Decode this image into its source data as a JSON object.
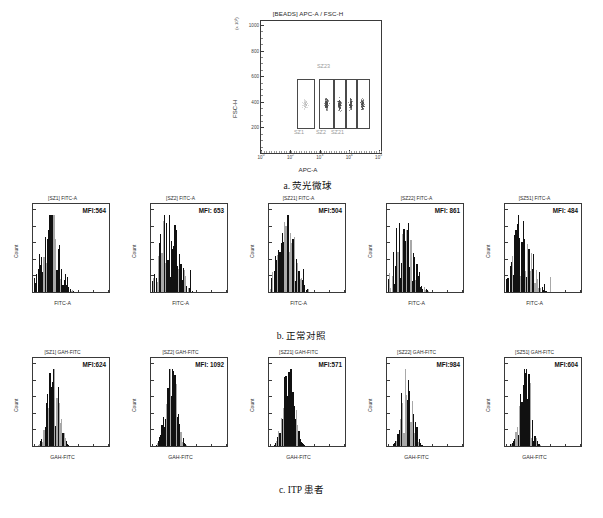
{
  "figure": {
    "scatter": {
      "title": "[BEADS] APC-A / FSC-H",
      "xlabel": "APC-A",
      "ylabel": "FSC-H",
      "y_multiplier": "(x 10³)",
      "caption": "a. 荧光微球",
      "y_ticks": [
        "200",
        "400",
        "600",
        "800",
        "1000"
      ],
      "x_ticks": [
        "10⁰",
        "10²",
        "10³",
        "10⁴",
        "10⁵"
      ],
      "gates": [
        {
          "label": "SZ1"
        },
        {
          "label": "SZ2"
        },
        {
          "label": "SZ21"
        },
        {
          "label": "SZ22"
        },
        {
          "label": "SZ23"
        }
      ],
      "upper_gate_label": "SZ23"
    },
    "row_b": {
      "caption": "b. 正常对照",
      "xlabel": "FITC-A",
      "ylabel": "Count",
      "panels": [
        {
          "title": "[SZ1] FITC-A",
          "mfi": "MFI:564"
        },
        {
          "title": "[SZ2] FITC-A",
          "mfi": "MFI: 653"
        },
        {
          "title": "[SZ21] FITC-A",
          "mfi": "MFI:504"
        },
        {
          "title": "[SZ22] FITC-A",
          "mfi": "MFI: 861"
        },
        {
          "title": "[SZ51] FITC-A",
          "mfi": "MFI: 484"
        }
      ]
    },
    "row_c": {
      "caption": "c. ITP 患者",
      "xlabel": "GAH-FITC",
      "ylabel": "Count",
      "panels": [
        {
          "title": "[SZ1] GAH-FITC",
          "mfi": "MFI:624"
        },
        {
          "title": "[SZ2] GAH-FITC",
          "mfi": "MFI: 1092"
        },
        {
          "title": "[SZ21] GAH-FITC",
          "mfi": "MFI:571"
        },
        {
          "title": "[SZ22] GAH-FITC",
          "mfi": "MFI:984"
        },
        {
          "title": "[SZ51] GAH-FITC",
          "mfi": "MFI:604"
        }
      ]
    }
  },
  "chart_data": {
    "type": "scatter",
    "title": "[BEADS] APC-A / FSC-H",
    "xlabel": "APC-A",
    "ylabel": "FSC-H",
    "xscale": "log",
    "xlim": [
      1,
      100000
    ],
    "ylim": [
      0,
      1000
    ],
    "grid": false,
    "legend": "none",
    "annotations": [
      "SZ1",
      "SZ2",
      "SZ21",
      "SZ22",
      "SZ23"
    ],
    "clusters": [
      {
        "name": "SZ1",
        "x_center": 120,
        "y_center": 420,
        "n": 60
      },
      {
        "name": "SZ2",
        "x_center": 900,
        "y_center": 420,
        "n": 130
      },
      {
        "name": "SZ21",
        "x_center": 2000,
        "y_center": 420,
        "n": 120
      },
      {
        "name": "SZ22",
        "x_center": 4200,
        "y_center": 415,
        "n": 100
      },
      {
        "name": "SZ23",
        "x_center": 8000,
        "y_center": 405,
        "n": 90
      }
    ],
    "histograms": [
      {
        "panel": "b1",
        "title": "[SZ1] FITC-A",
        "mfi": 564,
        "xlabel": "FITC-A",
        "ylabel": "Count"
      },
      {
        "panel": "b2",
        "title": "[SZ2] FITC-A",
        "mfi": 653,
        "xlabel": "FITC-A",
        "ylabel": "Count"
      },
      {
        "panel": "b3",
        "title": "[SZ21] FITC-A",
        "mfi": 504,
        "xlabel": "FITC-A",
        "ylabel": "Count"
      },
      {
        "panel": "b4",
        "title": "[SZ22] FITC-A",
        "mfi": 861,
        "xlabel": "FITC-A",
        "ylabel": "Count"
      },
      {
        "panel": "b5",
        "title": "[SZ51] FITC-A",
        "mfi": 484,
        "xlabel": "FITC-A",
        "ylabel": "Count"
      },
      {
        "panel": "c1",
        "title": "[SZ1] GAH-FITC",
        "mfi": 624,
        "xlabel": "GAH-FITC",
        "ylabel": "Count"
      },
      {
        "panel": "c2",
        "title": "[SZ2] GAH-FITC",
        "mfi": 1092,
        "xlabel": "GAH-FITC",
        "ylabel": "Count"
      },
      {
        "panel": "c3",
        "title": "[SZ21] GAH-FITC",
        "mfi": 571,
        "xlabel": "GAH-FITC",
        "ylabel": "Count"
      },
      {
        "panel": "c4",
        "title": "[SZ22] GAH-FITC",
        "mfi": 984,
        "xlabel": "GAH-FITC",
        "ylabel": "Count"
      },
      {
        "panel": "c5",
        "title": "[SZ51] GAH-FITC",
        "mfi": 604,
        "xlabel": "GAH-FITC",
        "ylabel": "Count"
      }
    ]
  }
}
